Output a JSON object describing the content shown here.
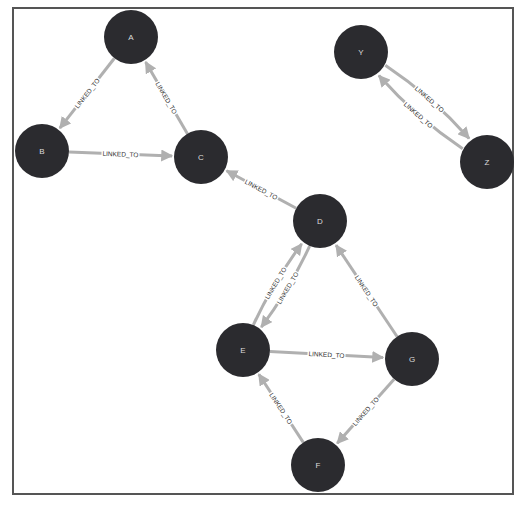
{
  "graph": {
    "colors": {
      "node": "#2b2b2f",
      "edge": "#b0b0b0",
      "border": "#555555",
      "node_label": "#dddddd",
      "edge_label": "#333333"
    },
    "node_radius": 27,
    "nodes": [
      {
        "id": "A",
        "label": "A",
        "x": 131,
        "y": 37
      },
      {
        "id": "B",
        "label": "B",
        "x": 42,
        "y": 151
      },
      {
        "id": "C",
        "label": "C",
        "x": 201,
        "y": 157
      },
      {
        "id": "Y",
        "label": "Y",
        "x": 361,
        "y": 52
      },
      {
        "id": "Z",
        "label": "Z",
        "x": 487,
        "y": 162
      },
      {
        "id": "D",
        "label": "D",
        "x": 320,
        "y": 221
      },
      {
        "id": "E",
        "label": "E",
        "x": 243,
        "y": 350
      },
      {
        "id": "G",
        "label": "G",
        "x": 412,
        "y": 359
      },
      {
        "id": "F",
        "label": "F",
        "x": 318,
        "y": 465
      }
    ],
    "edges": [
      {
        "from": "A",
        "to": "B",
        "label": "LINKED_TO",
        "curve": 0
      },
      {
        "from": "B",
        "to": "C",
        "label": "LINKED_TO",
        "curve": 0
      },
      {
        "from": "C",
        "to": "A",
        "label": "LINKED_TO",
        "curve": 0
      },
      {
        "from": "Y",
        "to": "Z",
        "label": "LINKED_TO",
        "curve": -12
      },
      {
        "from": "Z",
        "to": "Y",
        "label": "LINKED_TO",
        "curve": -12
      },
      {
        "from": "D",
        "to": "C",
        "label": "LINKED_TO",
        "curve": 0
      },
      {
        "from": "E",
        "to": "D",
        "label": "LINKED_TO",
        "curve": -8
      },
      {
        "from": "D",
        "to": "E",
        "label": "LINKED_TO",
        "curve": -8
      },
      {
        "from": "E",
        "to": "G",
        "label": "LINKED_TO",
        "curve": 0
      },
      {
        "from": "G",
        "to": "D",
        "label": "LINKED_TO",
        "curve": 0
      },
      {
        "from": "G",
        "to": "F",
        "label": "LINKED_TO",
        "curve": 0
      },
      {
        "from": "F",
        "to": "E",
        "label": "LINKED_TO",
        "curve": 0
      }
    ]
  }
}
